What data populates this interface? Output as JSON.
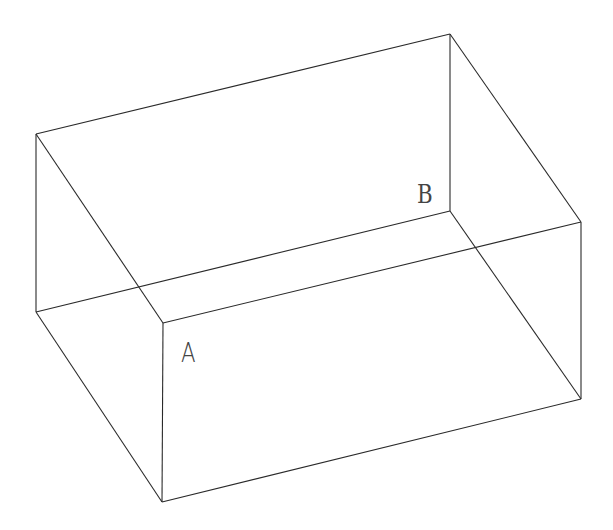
{
  "diagram": {
    "type": "wireframe-box",
    "background": "#ffffff",
    "stroke_color": "#2a2a2a",
    "vertices": {
      "P1": [
        36,
        134
      ],
      "P2": [
        450,
        34
      ],
      "P3": [
        450,
        211
      ],
      "P4": [
        581,
        222
      ],
      "P5": [
        36,
        312
      ],
      "P6": [
        163,
        323
      ],
      "P7": [
        162,
        502
      ],
      "P8": [
        581,
        399
      ]
    },
    "edges": [
      [
        "P1",
        "P2"
      ],
      [
        "P1",
        "P5"
      ],
      [
        "P1",
        "P6"
      ],
      [
        "P2",
        "P3"
      ],
      [
        "P2",
        "P4"
      ],
      [
        "P3",
        "P5"
      ],
      [
        "P3",
        "P8"
      ],
      [
        "P4",
        "P6"
      ],
      [
        "P4",
        "P8"
      ],
      [
        "P5",
        "P7"
      ],
      [
        "P6",
        "P7"
      ],
      [
        "P7",
        "P8"
      ]
    ],
    "labels": [
      {
        "id": "A",
        "text": "A",
        "x": 181,
        "y": 340
      },
      {
        "id": "B",
        "text": "B",
        "x": 417,
        "y": 181
      }
    ]
  }
}
